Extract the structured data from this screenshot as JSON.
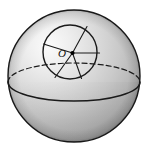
{
  "figure": {
    "type": "geometric-solid-diagram",
    "background_color": "#ffffff",
    "labels": {
      "center_point": "O"
    },
    "colors": {
      "outline": "#1a1a1a",
      "inner_circle_stroke": "#1a1a1a",
      "spoke_stroke": "#1a1a1a",
      "equator_solid": "#1a1a1a",
      "equator_dashed": "#1a1a1a",
      "center_dot": "#000000",
      "highlight": "#f2f2f2",
      "midtone": "#c8c8c8",
      "shadow": "#8e8e8e",
      "deep_shadow": "#7a7a7a"
    },
    "sphere": {
      "center_x": 74,
      "center_y": 76,
      "radius": 66,
      "highlight_x": 34,
      "highlight_y": 34
    },
    "equator": {
      "center_x": 74,
      "center_y": 82,
      "radius_x": 66,
      "radius_y": 19,
      "front_half": "solid",
      "back_half": "dashed",
      "dash_pattern": "5,3"
    },
    "inner_circle": {
      "center_x": 70,
      "center_y": 52,
      "radius": 27,
      "stroke_width": 1.4
    },
    "center_marker": {
      "x": 72.5,
      "y": 53,
      "radius": 2.1
    },
    "label_position": {
      "x": 62,
      "y": 57
    },
    "spokes": [
      {
        "name": "spoke-east",
        "angle_deg": 0,
        "x2": 99.5,
        "y2": 53.0
      },
      {
        "name": "spoke-northeast",
        "angle_deg": 68,
        "x2": 87.0,
        "y2": 26.5
      },
      {
        "name": "spoke-west",
        "angle_deg": 186,
        "x2": 43.5,
        "y2": 44.0
      },
      {
        "name": "spoke-southwest",
        "angle_deg": 244,
        "x2": 55.0,
        "y2": 77.5
      },
      {
        "name": "spoke-southeast",
        "angle_deg": 290,
        "x2": 81.5,
        "y2": 78.5
      }
    ]
  }
}
